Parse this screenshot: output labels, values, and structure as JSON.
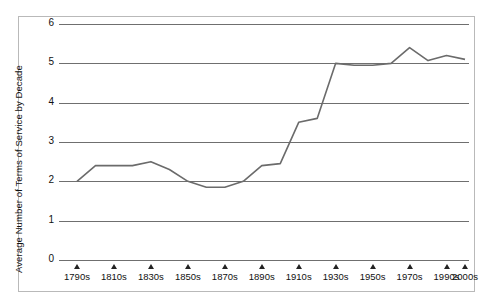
{
  "chart_data": {
    "type": "line",
    "title": "",
    "xlabel": "",
    "ylabel": "Average Number of Terms of Service by Decade",
    "ylim": [
      0,
      6
    ],
    "yticks": [
      0,
      1,
      2,
      3,
      4,
      5,
      6
    ],
    "grid": true,
    "legend": "none",
    "categories": [
      "1790s",
      "1800s",
      "1810s",
      "1820s",
      "1830s",
      "1840s",
      "1850s",
      "1860s",
      "1870s",
      "1880s",
      "1890s",
      "1900s",
      "1910s",
      "1920s",
      "1930s",
      "1940s",
      "1950s",
      "1960s",
      "1970s",
      "1980s",
      "1990s",
      "2000s"
    ],
    "tick_labels": [
      "1790s",
      "1810s",
      "1830s",
      "1850s",
      "1870s",
      "1890s",
      "1910s",
      "1930s",
      "1950s",
      "1970s",
      "1990s",
      "2000s"
    ],
    "values": [
      2.0,
      2.4,
      2.4,
      2.4,
      2.5,
      2.3,
      2.0,
      1.85,
      1.85,
      2.0,
      2.4,
      2.45,
      3.5,
      3.6,
      5.0,
      4.95,
      4.95,
      5.0,
      5.4,
      5.07,
      5.2,
      5.1
    ],
    "line_color": "#6b6b6b",
    "grid_color": "#6f6f6f"
  }
}
